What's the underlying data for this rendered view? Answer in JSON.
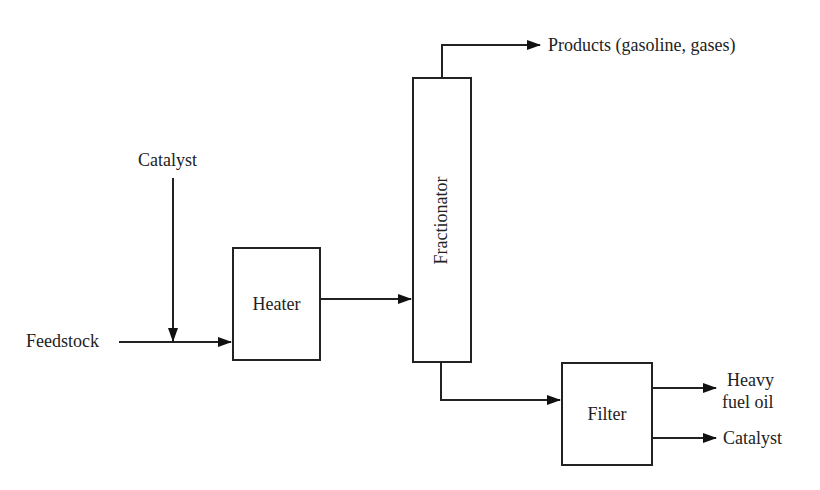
{
  "diagram": {
    "type": "process-flow",
    "nodes": {
      "heater": {
        "label": "Heater"
      },
      "fractionator": {
        "label": "Fractionator"
      },
      "filter": {
        "label": "Filter"
      }
    },
    "inputs": {
      "feedstock": "Feedstock",
      "catalyst_in": "Catalyst"
    },
    "outputs": {
      "products": "Products (gasoline, gases)",
      "heavy_fuel_oil_line1": "Heavy",
      "heavy_fuel_oil_line2": "fuel oil",
      "catalyst_out": "Catalyst"
    },
    "edges": [
      {
        "from": "Feedstock",
        "to": "Heater"
      },
      {
        "from": "Catalyst",
        "to": "Feedstock line"
      },
      {
        "from": "Heater",
        "to": "Fractionator"
      },
      {
        "from": "Fractionator",
        "to": "Products (gasoline, gases)"
      },
      {
        "from": "Fractionator",
        "to": "Filter"
      },
      {
        "from": "Filter",
        "to": "Heavy fuel oil"
      },
      {
        "from": "Filter",
        "to": "Catalyst"
      }
    ]
  }
}
